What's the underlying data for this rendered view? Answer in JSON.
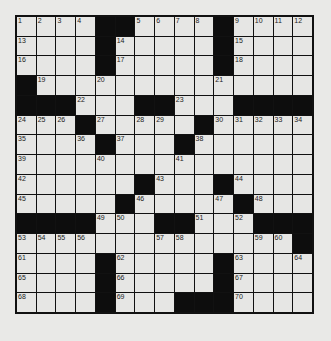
{
  "puzzle": {
    "rows": 15,
    "cols": 15,
    "colors": {
      "block": "#0d0d0d",
      "cell": "#e6e6e4",
      "background": "#e9e9e7",
      "line": "#111111"
    },
    "layout": [
      "....##....#....",
      "....#.....#....",
      "....#.....#....",
      "#..............",
      "###...##...####",
      "...#.....#.....",
      "....#...#......",
      "...............",
      "......#...#....",
      ".....#.....#...",
      "####...##...###",
      "..............#",
      "....#.....#....",
      "....#.....#....",
      "....#...###...."
    ],
    "numbers": [
      [
        1,
        2,
        3,
        4,
        null,
        null,
        5,
        6,
        7,
        8,
        null,
        9,
        10,
        11,
        12
      ],
      [
        13,
        null,
        null,
        null,
        null,
        14,
        null,
        null,
        null,
        null,
        null,
        15,
        null,
        null,
        null
      ],
      [
        16,
        null,
        null,
        null,
        null,
        17,
        null,
        null,
        null,
        null,
        null,
        18,
        null,
        null,
        null
      ],
      [
        null,
        19,
        null,
        null,
        20,
        null,
        null,
        null,
        null,
        null,
        21,
        null,
        null,
        null,
        null
      ],
      [
        null,
        null,
        null,
        22,
        null,
        null,
        null,
        null,
        23,
        null,
        null,
        null,
        null,
        null,
        null
      ],
      [
        24,
        25,
        26,
        null,
        27,
        null,
        28,
        29,
        null,
        null,
        30,
        31,
        32,
        33,
        34
      ],
      [
        35,
        null,
        null,
        36,
        null,
        37,
        null,
        null,
        null,
        38,
        null,
        null,
        null,
        null,
        null
      ],
      [
        39,
        null,
        null,
        null,
        40,
        null,
        null,
        null,
        41,
        null,
        null,
        null,
        null,
        null,
        null
      ],
      [
        42,
        null,
        null,
        null,
        null,
        null,
        null,
        43,
        null,
        null,
        null,
        44,
        null,
        null,
        null
      ],
      [
        45,
        null,
        null,
        null,
        null,
        null,
        46,
        null,
        null,
        null,
        47,
        null,
        48,
        null,
        null
      ],
      [
        null,
        null,
        null,
        null,
        49,
        50,
        null,
        null,
        null,
        51,
        null,
        52,
        null,
        null,
        null
      ],
      [
        53,
        54,
        55,
        56,
        null,
        null,
        null,
        57,
        58,
        null,
        null,
        null,
        59,
        60,
        null
      ],
      [
        61,
        null,
        null,
        null,
        null,
        62,
        null,
        null,
        null,
        null,
        null,
        63,
        null,
        null,
        64
      ],
      [
        65,
        null,
        null,
        null,
        null,
        66,
        null,
        null,
        null,
        null,
        null,
        67,
        null,
        null,
        null
      ],
      [
        68,
        null,
        null,
        null,
        null,
        69,
        null,
        null,
        null,
        null,
        null,
        70,
        null,
        null,
        null
      ]
    ]
  }
}
